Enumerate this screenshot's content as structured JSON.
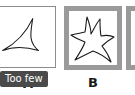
{
  "canvas": {
    "width": 135,
    "height": 95,
    "background": "#ffffff"
  },
  "colors": {
    "frame_gray": "#9a9a9a",
    "thin_border_gray": "#8c8c8c",
    "stroke_black": "#1a1a1a",
    "badge_bg": "#4a4a4a",
    "badge_text": "#ffffff",
    "panel_fill": "#ffffff"
  },
  "panels": [
    {
      "id": "a",
      "label": "A",
      "cropped": true,
      "frame_style": "thin",
      "shape_name": "concave-triangle-deltoid",
      "shape_points": 3,
      "annotation": "Too few"
    },
    {
      "id": "b",
      "label": "B",
      "cropped": false,
      "frame_style": "thick",
      "shape_name": "concave-five-point-star",
      "shape_points": 5,
      "annotation": ""
    },
    {
      "id": "c",
      "label": "",
      "cropped": true,
      "frame_style": "thick",
      "shape_name": "",
      "shape_points": 0,
      "annotation": ""
    }
  ],
  "badge": {
    "text": "Too few"
  }
}
